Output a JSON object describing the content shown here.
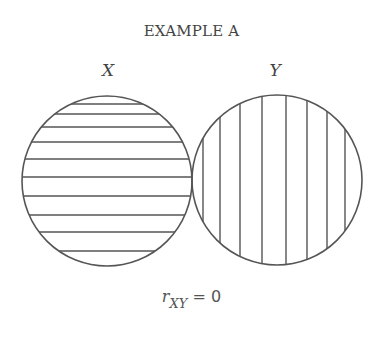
{
  "diagram": {
    "title": "EXAMPLE A",
    "sets": [
      {
        "label": "X",
        "hatch": "horizontal",
        "cx": 107,
        "cy": 181,
        "r": 85,
        "hatch_positions": [
          104,
          114,
          127,
          142,
          159,
          177,
          196,
          215,
          232,
          251
        ]
      },
      {
        "label": "Y",
        "hatch": "vertical",
        "cx": 277,
        "cy": 180,
        "r": 85,
        "hatch_positions": [
          203,
          220,
          240,
          262,
          286,
          307,
          327,
          345
        ]
      }
    ],
    "formula": {
      "variable": "r",
      "subscript": "XY",
      "relation": " = 0"
    },
    "colors": {
      "stroke": "#555555",
      "text": "#444444",
      "background": "#ffffff"
    }
  }
}
